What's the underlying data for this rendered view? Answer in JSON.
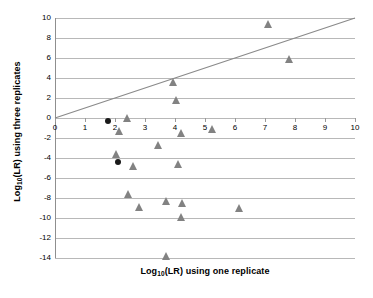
{
  "chart_data": {
    "type": "scatter",
    "title": "",
    "xlabel": "Log10(LR) using one replicate",
    "ylabel": "Log10(LR) using three replicates",
    "xlabel_parts": {
      "pre": "Log",
      "sub": "10",
      "post": "(LR) using one replicate"
    },
    "ylabel_parts": {
      "pre": "Log",
      "sub": "10",
      "post": "(LR) using three replicates"
    },
    "xlim": [
      0,
      10
    ],
    "ylim": [
      -14,
      10
    ],
    "xticks": [
      0,
      1,
      2,
      3,
      4,
      5,
      6,
      7,
      8,
      9,
      10
    ],
    "xtick_labels": [
      "0",
      "1",
      "2",
      "3",
      "4",
      "5",
      "6",
      "7",
      "8",
      "9",
      "10"
    ],
    "yticks": [
      10,
      8,
      6,
      4,
      2,
      0,
      -2,
      -4,
      -6,
      -8,
      -10,
      -12,
      -14
    ],
    "ytick_labels": [
      "10",
      "8",
      "6",
      "4",
      "2",
      "0",
      "-2",
      "-4",
      "-6",
      "-8",
      "-10",
      "-12",
      "-14"
    ],
    "grid": "horizontal",
    "grid_color": "#b8b8b8",
    "legend": "none",
    "reference_line": {
      "name": "y = x identity line",
      "from": [
        0,
        0
      ],
      "to": [
        10,
        10
      ],
      "color": "#8a8a8a",
      "width": 1.2
    },
    "series": [
      {
        "name": "triangles",
        "marker": "triangle",
        "color": "#828282",
        "points": [
          [
            2.4,
            -0.05
          ],
          [
            2.15,
            -1.35
          ],
          [
            2.05,
            -3.65
          ],
          [
            2.6,
            -4.85
          ],
          [
            2.45,
            -7.65
          ],
          [
            2.8,
            -8.95
          ],
          [
            3.45,
            -2.8
          ],
          [
            3.7,
            -8.35
          ],
          [
            3.7,
            -13.9
          ],
          [
            3.95,
            3.5
          ],
          [
            4.05,
            1.75
          ],
          [
            4.1,
            -4.65
          ],
          [
            4.2,
            -1.55
          ],
          [
            4.25,
            -8.6
          ],
          [
            4.2,
            -10.0
          ],
          [
            5.25,
            -1.2
          ],
          [
            6.15,
            -9.1
          ],
          [
            7.1,
            9.3
          ],
          [
            7.8,
            5.8
          ]
        ]
      },
      {
        "name": "black circles",
        "marker": "circle",
        "color": "#1a1a1a",
        "points": [
          [
            1.75,
            -0.25
          ],
          [
            2.1,
            -4.4
          ]
        ]
      }
    ]
  }
}
